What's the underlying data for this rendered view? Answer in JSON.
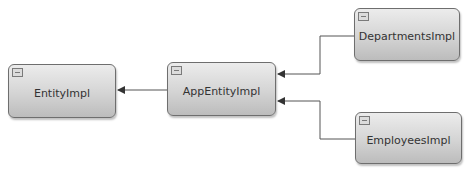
{
  "diagram": {
    "type": "class-hierarchy",
    "nodes": [
      {
        "id": "entity",
        "label": "EntityImpl",
        "collapse_icon": "collapse-icon"
      },
      {
        "id": "app",
        "label": "AppEntityImpl",
        "collapse_icon": "collapse-icon"
      },
      {
        "id": "departments",
        "label": "DepartmentsImpl",
        "collapse_icon": "collapse-icon"
      },
      {
        "id": "employees",
        "label": "EmployeesImpl",
        "collapse_icon": "collapse-icon"
      }
    ],
    "edges": [
      {
        "from": "AppEntityImpl",
        "to": "EntityImpl",
        "style": "arrow"
      },
      {
        "from": "DepartmentsImpl",
        "to": "AppEntityImpl",
        "style": "elbow-arrow"
      },
      {
        "from": "EmployeesImpl",
        "to": "AppEntityImpl",
        "style": "elbow-arrow"
      }
    ],
    "colors": {
      "node_fill_top": "#ececec",
      "node_fill_bottom": "#bcbcbc",
      "node_border": "#6e6e6e",
      "edge": "#555555",
      "background": "#ffffff"
    }
  }
}
